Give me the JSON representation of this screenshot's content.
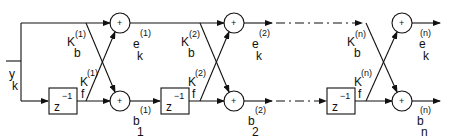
{
  "diagram": {
    "type": "lattice filter block diagram",
    "input": {
      "symbol": "y",
      "subscript": "k"
    },
    "delay_label": {
      "base": "z",
      "exp": "−1"
    },
    "adder_symbol": "+",
    "stages": [
      {
        "index": "1",
        "kb": {
          "base": "K",
          "sub": "b",
          "sup": "(1)"
        },
        "kf": {
          "base": "K",
          "sub": "f",
          "sup": "(1)"
        },
        "e_out": {
          "base": "e",
          "sub": "k",
          "sup": "(1)"
        },
        "b_out": {
          "base": "b",
          "sub": "1",
          "sup": "(1)"
        }
      },
      {
        "index": "2",
        "kb": {
          "base": "K",
          "sub": "b",
          "sup": "(2)"
        },
        "kf": {
          "base": "K",
          "sub": "f",
          "sup": "(2)"
        },
        "e_out": {
          "base": "e",
          "sub": "k",
          "sup": "(2)"
        },
        "b_out": {
          "base": "b",
          "sub": "2",
          "sup": "(2)"
        }
      },
      {
        "index": "n",
        "kb": {
          "base": "K",
          "sub": "b",
          "sup": "(n)"
        },
        "kf": {
          "base": "K",
          "sub": "f",
          "sup": "(n)"
        },
        "e_out": {
          "base": "e",
          "sub": "k",
          "sup": "(n)"
        },
        "b_out": {
          "base": "b",
          "sub": "n",
          "sup": "(n)"
        }
      }
    ]
  }
}
